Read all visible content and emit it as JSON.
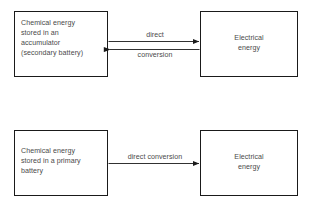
{
  "diagram": {
    "type": "block-flow-diagram",
    "background_color": "#ffffff",
    "stroke_color": "#1a1a1a",
    "text_color": "#4a4a4a",
    "groups": [
      {
        "id": "secondary-battery-group",
        "name": "Accumulator / secondary battery conversion",
        "source": {
          "id": "accumulator-box",
          "label": "Chemical energy\nstored in an\naccumulator\n(secondary battery)",
          "align": "left"
        },
        "target": {
          "id": "electrical-energy-box-top",
          "label": "Electrical\nenergy",
          "align": "center"
        },
        "edges": [
          {
            "id": "edge-direct-forward",
            "label": "direct",
            "direction": "source-to-target",
            "arrowhead": "end"
          },
          {
            "id": "edge-conversion-reverse",
            "label": "conversion",
            "direction": "target-to-source",
            "arrowhead": "start"
          }
        ]
      },
      {
        "id": "primary-battery-group",
        "name": "Primary battery conversion",
        "source": {
          "id": "primary-battery-box",
          "label": "Chemical energy\nstored in a primary\nbattery",
          "align": "left"
        },
        "target": {
          "id": "electrical-energy-box-bottom",
          "label": "Electrical\nenergy",
          "align": "center"
        },
        "edges": [
          {
            "id": "edge-direct-conversion",
            "label": "direct\nconversion",
            "direction": "source-to-target",
            "arrowhead": "end"
          }
        ]
      }
    ]
  }
}
